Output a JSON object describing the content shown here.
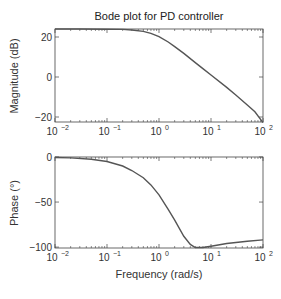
{
  "chart_data": [
    {
      "type": "line",
      "panel": "magnitude",
      "title": "Bode plot for PD controller",
      "xlabel": "",
      "ylabel": "Magnitude (dB)",
      "xscale": "log",
      "xlim": [
        0.01,
        100
      ],
      "ylim": [
        -22.5,
        24
      ],
      "xticks": [
        0.01,
        0.1,
        1,
        10,
        100
      ],
      "xtick_labels": [
        "10^-2",
        "10^-1",
        "10^0",
        "10^1",
        "10^2"
      ],
      "yticks": [
        20,
        0,
        -20
      ],
      "ytick_labels": [
        "20",
        "0",
        "−20"
      ],
      "grid": false,
      "series": [
        {
          "name": "magnitude",
          "color": "#555555",
          "x": [
            0.01,
            0.03,
            0.1,
            0.2,
            0.3,
            0.5,
            0.7,
            1,
            1.5,
            2,
            3,
            5,
            7,
            10,
            20,
            30,
            50,
            70,
            100
          ],
          "y": [
            24,
            24,
            23.9,
            23.8,
            23.5,
            22.8,
            21.8,
            20.2,
            17.5,
            15.2,
            11.8,
            7.2,
            4.2,
            1.0,
            -5.2,
            -9.0,
            -14.0,
            -17.4,
            -22.8
          ]
        }
      ]
    },
    {
      "type": "line",
      "panel": "phase",
      "title": "",
      "xlabel": "Frequency (rad/s)",
      "ylabel": "Phase (°)",
      "xscale": "log",
      "xlim": [
        0.01,
        100
      ],
      "ylim": [
        -101,
        0
      ],
      "xticks": [
        0.01,
        0.1,
        1,
        10,
        100
      ],
      "xtick_labels": [
        "10^-2",
        "10^-1",
        "10^0",
        "10^1",
        "10^2"
      ],
      "yticks": [
        0,
        -50,
        -100
      ],
      "ytick_labels": [
        "0",
        "−50",
        "−100"
      ],
      "grid": false,
      "series": [
        {
          "name": "phase",
          "color": "#555555",
          "x": [
            0.01,
            0.02,
            0.05,
            0.1,
            0.2,
            0.3,
            0.5,
            0.7,
            1,
            1.5,
            2,
            3,
            4,
            5,
            7,
            10,
            20,
            50,
            100
          ],
          "y": [
            -0.5,
            -1,
            -2.5,
            -5,
            -10,
            -15,
            -23,
            -31,
            -42,
            -58,
            -70,
            -88,
            -97,
            -100.5,
            -100.5,
            -99,
            -96,
            -93.5,
            -92
          ]
        }
      ]
    }
  ]
}
